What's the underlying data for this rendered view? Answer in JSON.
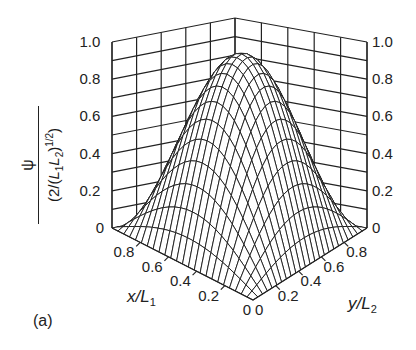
{
  "chart_data": {
    "type": "surface3d",
    "title": "",
    "panel_label": "(a)",
    "function": "psi = sin(pi*x/L1) * sin(pi*y/L2), normalized by (2/(L1 L2))^(1/2)",
    "xlabel": "x/L1",
    "ylabel": "y/L2",
    "zlabel": "psi / (2/(L1 L2))^(1/2)",
    "x_ticks": [
      "0",
      "0.2",
      "0.4",
      "0.6",
      "0.8"
    ],
    "y_ticks": [
      "0",
      "0.2",
      "0.4",
      "0.6",
      "0.8"
    ],
    "z_ticks_left": [
      "0",
      "0.2",
      "0.4",
      "0.6",
      "0.8",
      "1.0"
    ],
    "z_ticks_right": [
      "0",
      "0.2",
      "0.4",
      "0.6",
      "0.8",
      "1.0"
    ],
    "xlim": [
      0,
      1
    ],
    "ylim": [
      0,
      1
    ],
    "zlim": [
      0,
      1
    ],
    "grid": true,
    "peak": {
      "x": 0.5,
      "y": 0.5,
      "z": 1.0
    },
    "mesh_lines_x": 24,
    "mesh_lines_y": 10,
    "samples": [
      {
        "x": 0.0,
        "y": 0.5,
        "z": 0.0
      },
      {
        "x": 0.25,
        "y": 0.5,
        "z": 0.71
      },
      {
        "x": 0.5,
        "y": 0.5,
        "z": 1.0
      },
      {
        "x": 0.5,
        "y": 0.25,
        "z": 0.71
      },
      {
        "x": 0.25,
        "y": 0.25,
        "z": 0.5
      },
      {
        "x": 0.75,
        "y": 0.75,
        "z": 0.5
      }
    ]
  },
  "labels": {
    "x_axis_main": "x",
    "x_axis_slash": "/",
    "x_axis_L": "L",
    "x_axis_sub": "1",
    "y_axis_main": "y",
    "y_axis_slash": "/",
    "y_axis_L": "L",
    "y_axis_sub": "2",
    "z_num": "ψ",
    "z_den_pre": "(2/(",
    "z_den_L1": "L",
    "z_den_sub1": "1",
    "z_den_L2": "L",
    "z_den_sub2": "2",
    "z_den_post": ")",
    "z_den_sup": "1/2",
    "z_den_close": ")"
  }
}
